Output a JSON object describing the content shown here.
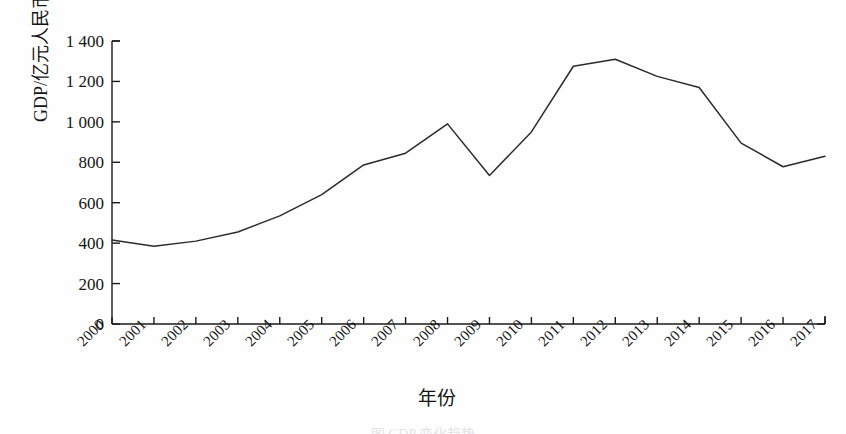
{
  "chart_data": {
    "type": "line",
    "title": "",
    "xlabel": "年份",
    "ylabel": "GDP/亿元人民币",
    "categories": [
      "2000",
      "2001",
      "2002",
      "2003",
      "2004",
      "2005",
      "2006",
      "2007",
      "2008",
      "2009",
      "2010",
      "2011",
      "2012",
      "2013",
      "2014",
      "2015",
      "2016",
      "2017"
    ],
    "values": [
      415,
      385,
      410,
      455,
      535,
      640,
      787,
      845,
      990,
      735,
      950,
      1275,
      1310,
      1225,
      1170,
      895,
      778,
      830
    ],
    "x": [
      2000,
      2001,
      2002,
      2003,
      2004,
      2005,
      2006,
      2007,
      2008,
      2009,
      2010,
      2011,
      2012,
      2013,
      2014,
      2015,
      2016,
      2017
    ],
    "ylim": [
      0,
      1400
    ],
    "xlim": [
      2000,
      2017
    ],
    "ytick_labels": [
      "1 400",
      "1 200",
      "1 000",
      "800",
      "600",
      "400",
      "200",
      "0"
    ],
    "ytick_values": [
      1400,
      1200,
      1000,
      800,
      600,
      400,
      200,
      0
    ],
    "ytick_step": 200,
    "grid": false,
    "legend": null,
    "legend_position": "none",
    "series": [
      {
        "name": "GDP",
        "color": "#2b2b2b",
        "values": [
          415,
          385,
          410,
          455,
          535,
          640,
          787,
          845,
          990,
          735,
          950,
          1275,
          1310,
          1225,
          1170,
          895,
          778,
          830
        ]
      }
    ],
    "annotations": []
  },
  "axes": {
    "spine_color": "#1a1a1a",
    "line_color": "#2b2b2b",
    "background": "#ffffff"
  },
  "caption": {
    "text": "图 GDP 变化趋势"
  }
}
